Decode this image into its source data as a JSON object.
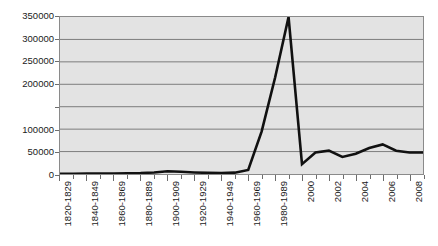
{
  "chart_data": {
    "type": "line",
    "title": "",
    "subtitle": "",
    "xlabel": "",
    "ylabel": "",
    "grid": true,
    "legend": false,
    "legend_position": "none",
    "ylim": [
      0,
      350000
    ],
    "y_ticks": [
      {
        "value": 350000,
        "label": "350000"
      },
      {
        "value": 300000,
        "label": "300000"
      },
      {
        "value": 250000,
        "label": "250000"
      },
      {
        "value": 200000,
        "label": "200000"
      },
      {
        "value": 150000,
        "label": ""
      },
      {
        "value": 100000,
        "label": "100000"
      },
      {
        "value": 50000,
        "label": "50000"
      },
      {
        "value": 0,
        "label": "0"
      }
    ],
    "categories": [
      "1820-1829",
      "1830-1839",
      "1840-1849",
      "1850-1859",
      "1860-1869",
      "1870-1879",
      "1880-1889",
      "1890-1899",
      "1900-1909",
      "1910-1919",
      "1920-1929",
      "1930-1939",
      "1940-1949",
      "1950-1959",
      "1960-1969",
      "1970-1979",
      "1980-1989",
      "1990-1999",
      "2000",
      "2001",
      "2002",
      "2003",
      "2004",
      "2005",
      "2006",
      "2007",
      "2008",
      "2009"
    ],
    "tick_labels": [
      "1820-1829",
      "",
      "1840-1849",
      "",
      "1860-1869",
      "",
      "1880-1889",
      "",
      "1900-1909",
      "",
      "1920-1929",
      "",
      "1940-1949",
      "",
      "1960-1969",
      "",
      "1980-1989",
      "",
      "2000",
      "",
      "2002",
      "",
      "2004",
      "",
      "2006",
      "",
      "2008",
      ""
    ],
    "values": [
      500,
      600,
      800,
      900,
      1200,
      1500,
      2000,
      3500,
      6000,
      5000,
      3500,
      2500,
      2000,
      3000,
      9000,
      95000,
      215000,
      350000,
      22000,
      48000,
      52000,
      38000,
      45000,
      58000,
      66000,
      52000,
      48000,
      48000
    ],
    "series_name": "",
    "line_color": "#111111",
    "plot_background": "#e3e3e3",
    "grid_color": "#7d7d7d",
    "axis_color": "#8a8a8a"
  }
}
